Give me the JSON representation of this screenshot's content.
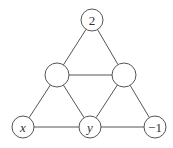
{
  "diagram": {
    "type": "triangular-number-grid",
    "nodes": [
      {
        "id": "top",
        "label": "2",
        "italic": false,
        "cx": 92,
        "cy": 20,
        "r": 11
      },
      {
        "id": "mid-left",
        "label": "",
        "italic": false,
        "cx": 57,
        "cy": 75,
        "r": 12
      },
      {
        "id": "mid-right",
        "label": "",
        "italic": false,
        "cx": 124,
        "cy": 75,
        "r": 12
      },
      {
        "id": "bot-left",
        "label": "x",
        "italic": true,
        "cx": 23,
        "cy": 127,
        "r": 11
      },
      {
        "id": "bot-mid",
        "label": "y",
        "italic": true,
        "cx": 90,
        "cy": 127,
        "r": 11
      },
      {
        "id": "bot-right",
        "label": "−1",
        "italic": false,
        "cx": 155,
        "cy": 127,
        "r": 11
      }
    ],
    "edges": [
      [
        "top",
        "mid-left"
      ],
      [
        "top",
        "mid-right"
      ],
      [
        "mid-left",
        "mid-right"
      ],
      [
        "mid-left",
        "bot-left"
      ],
      [
        "mid-left",
        "bot-mid"
      ],
      [
        "mid-right",
        "bot-mid"
      ],
      [
        "mid-right",
        "bot-right"
      ],
      [
        "bot-left",
        "bot-mid"
      ],
      [
        "bot-mid",
        "bot-right"
      ]
    ],
    "colors": {
      "stroke": "#555555",
      "text": "#333333",
      "background": "#ffffff"
    }
  }
}
